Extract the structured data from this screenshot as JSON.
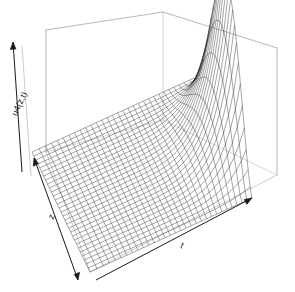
{
  "figure": {
    "kind": "persp-3d-surface-wireframe",
    "background_color": "#ffffff",
    "width": 295,
    "height": 292
  },
  "axes": {
    "vertical": {
      "label": "u4(z,t)",
      "name": "u4(z,t)",
      "has_arrow": true,
      "rotation_deg": -64
    },
    "depth": {
      "label": "z",
      "name": "z",
      "has_arrow": true,
      "rotation_deg": -64
    },
    "horizontal": {
      "label": "t",
      "name": "t",
      "has_arrow": true,
      "rotation_deg": 24
    }
  },
  "chart_data": {
    "type": "surface",
    "title": "",
    "xlabel": "t",
    "ylabel": "z",
    "zlabel": "u4(z,t)",
    "grid": false,
    "legend": "none",
    "mesh": {
      "nt": 30,
      "nz": 30
    },
    "xlim": [
      0,
      1
    ],
    "ylim": [
      0,
      1
    ],
    "zlim": [
      0,
      1
    ],
    "style": {
      "line_color": "#222222",
      "line_width": 0.4,
      "box_color": "#9a9a9a",
      "box_width": 0.6,
      "face_color": "#ffffff"
    },
    "projection": {
      "theta_deg": 30,
      "phi_deg": 20,
      "origin_px": [
        90,
        272
      ],
      "t_axis_px": [
        252,
        198
      ],
      "z_axis_px": [
        32,
        152
      ],
      "v_axis_px": [
        90,
        170
      ]
    },
    "surface_model": {
      "formula": "u4(z,t) = exp(-k*(1-t)) * sin(pi*z)^p",
      "ridge_position_t": 1.0,
      "ridge_peak_z": 0.42,
      "peak_value": 1.0,
      "floor_value": 0.0
    },
    "samples": {
      "t": [
        0.0,
        0.1,
        0.2,
        0.3,
        0.4,
        0.5,
        0.6,
        0.7,
        0.8,
        0.9,
        1.0
      ],
      "z_at_peak": 0.42,
      "ridge_profile": [
        0.01,
        0.015,
        0.022,
        0.034,
        0.052,
        0.082,
        0.135,
        0.24,
        0.44,
        0.76,
        1.0
      ]
    }
  }
}
